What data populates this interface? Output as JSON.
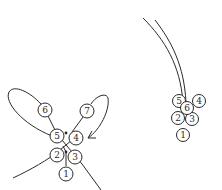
{
  "diagram": {
    "colors": {
      "stroke": "#2a2a2a",
      "background": "#ffffff"
    },
    "left_cluster": {
      "beads": [
        {
          "label": "6",
          "cx": 45,
          "cy": 110
        },
        {
          "label": "7",
          "cx": 87,
          "cy": 111
        },
        {
          "label": "5",
          "cx": 57,
          "cy": 136
        },
        {
          "label": "4",
          "cx": 76,
          "cy": 138
        },
        {
          "label": "2",
          "cx": 57,
          "cy": 155
        },
        {
          "label": "3",
          "cx": 75,
          "cy": 157
        },
        {
          "label": "1",
          "cx": 66,
          "cy": 174
        }
      ],
      "arrow": "arrow-into-bead-4"
    },
    "right_cluster": {
      "beads": [
        {
          "label": "5",
          "cx": 179,
          "cy": 101
        },
        {
          "label": "4",
          "cx": 199,
          "cy": 101
        },
        {
          "label": "6",
          "cx": 187,
          "cy": 108
        },
        {
          "label": "2",
          "cx": 178,
          "cy": 118
        },
        {
          "label": "3",
          "cx": 192,
          "cy": 119
        },
        {
          "label": "1",
          "cx": 183,
          "cy": 135
        }
      ]
    }
  }
}
